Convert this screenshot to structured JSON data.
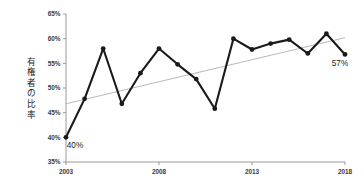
{
  "chart_data": {
    "type": "line",
    "title": "",
    "subtitle": "",
    "xlabel": "",
    "ylabel": "有権者の比率",
    "ylim": [
      35,
      65
    ],
    "xlim": [
      2003,
      2018
    ],
    "grid": false,
    "legend": null,
    "y_tick_labels": [
      "65%",
      "60%",
      "55%",
      "50%",
      "45%",
      "40%",
      "35%"
    ],
    "y_tick_values": [
      65,
      60,
      55,
      50,
      45,
      40,
      35
    ],
    "x_tick_labels": [
      "2003",
      "2008",
      "2013",
      "2018"
    ],
    "x_tick_values": [
      2003,
      2008,
      2013,
      2018
    ],
    "x": [
      2003,
      2004,
      2005,
      2006,
      2007,
      2008,
      2009,
      2010,
      2011,
      2012,
      2013,
      2014,
      2015,
      2016,
      2017,
      2018
    ],
    "series": [
      {
        "name": "有権者の比率",
        "values": [
          40.0,
          47.8,
          58.0,
          46.8,
          53.0,
          58.0,
          54.8,
          51.8,
          45.8,
          60.0,
          57.8,
          59.0,
          59.8,
          57.0,
          61.0,
          56.8
        ],
        "color": "#1a1a1a",
        "marker": "circle"
      }
    ],
    "trendline": {
      "name": "trend",
      "x_start": 2003,
      "y_start": 46.8,
      "x_end": 2018,
      "y_end": 60.2,
      "color": "#b0b0b0"
    },
    "annotations": [
      {
        "text": "40%",
        "x": 2003,
        "y": 40.0,
        "position": "below-right"
      },
      {
        "text": "57%",
        "x": 2018,
        "y": 56.8,
        "position": "below-left"
      }
    ],
    "axis_color": "#9a9a9a",
    "line_color": "#1a1a1a"
  }
}
